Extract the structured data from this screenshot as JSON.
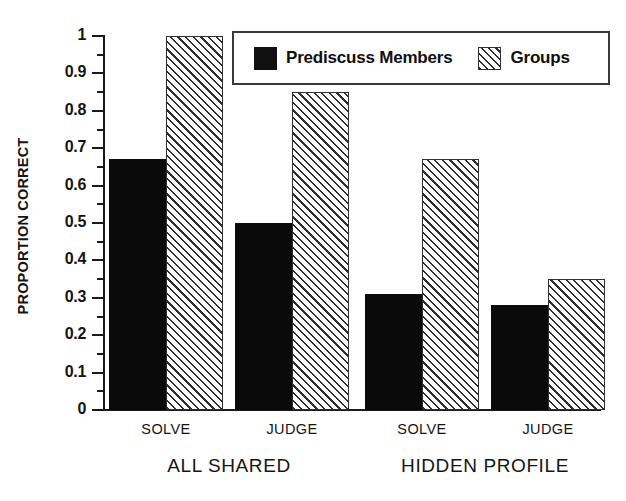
{
  "chart_data": {
    "type": "bar",
    "title": "",
    "xlabel": "",
    "ylabel": "PROPORTION CORRECT",
    "ylim": [
      0,
      1
    ],
    "ytick_labels": [
      "0",
      "0.1",
      "0.2",
      "0.3",
      "0.4",
      "0.5",
      "0.6",
      "0.7",
      "0.8",
      "0.9",
      "1"
    ],
    "ytick_values": [
      0,
      0.1,
      0.2,
      0.3,
      0.4,
      0.5,
      0.6,
      0.7,
      0.8,
      0.9,
      1
    ],
    "yminor_values": [
      0.05,
      0.15,
      0.25,
      0.35,
      0.45,
      0.55,
      0.65,
      0.75,
      0.85,
      0.95
    ],
    "grid": false,
    "legend_position": "top-right",
    "categories": [
      "SOLVE",
      "JUDGE",
      "SOLVE",
      "JUDGE"
    ],
    "group_labels": [
      "ALL SHARED",
      "HIDDEN PROFILE"
    ],
    "groups": [
      {
        "label": "ALL SHARED",
        "categories": [
          "SOLVE",
          "JUDGE"
        ]
      },
      {
        "label": "HIDDEN PROFILE",
        "categories": [
          "SOLVE",
          "JUDGE"
        ]
      }
    ],
    "series": [
      {
        "name": "Prediscuss Members",
        "fill": "solid-black",
        "color": "#0a0a0a",
        "values": [
          0.67,
          0.5,
          0.31,
          0.28
        ]
      },
      {
        "name": "Groups",
        "fill": "diagonal-hatch",
        "color": "#2e2e2e",
        "values": [
          1.0,
          0.85,
          0.67,
          0.35
        ]
      }
    ],
    "bars": [
      {
        "group": "ALL SHARED",
        "category": "SOLVE",
        "series": "Prediscuss Members",
        "value": 0.67
      },
      {
        "group": "ALL SHARED",
        "category": "SOLVE",
        "series": "Groups",
        "value": 1.0
      },
      {
        "group": "ALL SHARED",
        "category": "JUDGE",
        "series": "Prediscuss Members",
        "value": 0.5
      },
      {
        "group": "ALL SHARED",
        "category": "JUDGE",
        "series": "Groups",
        "value": 0.85
      },
      {
        "group": "HIDDEN PROFILE",
        "category": "SOLVE",
        "series": "Prediscuss Members",
        "value": 0.31
      },
      {
        "group": "HIDDEN PROFILE",
        "category": "SOLVE",
        "series": "Groups",
        "value": 0.67
      },
      {
        "group": "HIDDEN PROFILE",
        "category": "JUDGE",
        "series": "Prediscuss Members",
        "value": 0.28
      },
      {
        "group": "HIDDEN PROFILE",
        "category": "JUDGE",
        "series": "Groups",
        "value": 0.35
      }
    ]
  },
  "axis": {
    "y_title": "PROPORTION CORRECT"
  },
  "legend": {
    "entries": [
      {
        "label": "Prediscuss Members",
        "swatch": "solid-black"
      },
      {
        "label": "Groups",
        "swatch": "diagonal-hatch"
      }
    ]
  },
  "x_labels": {
    "sub": [
      "SOLVE",
      "JUDGE",
      "SOLVE",
      "JUDGE"
    ],
    "groups": [
      "ALL SHARED",
      "HIDDEN PROFILE"
    ]
  },
  "colors": {
    "series_1": "#0a0a0a",
    "series_2": "#2e2e2e",
    "axis": "#1a1a1a",
    "background": "#ffffff"
  }
}
